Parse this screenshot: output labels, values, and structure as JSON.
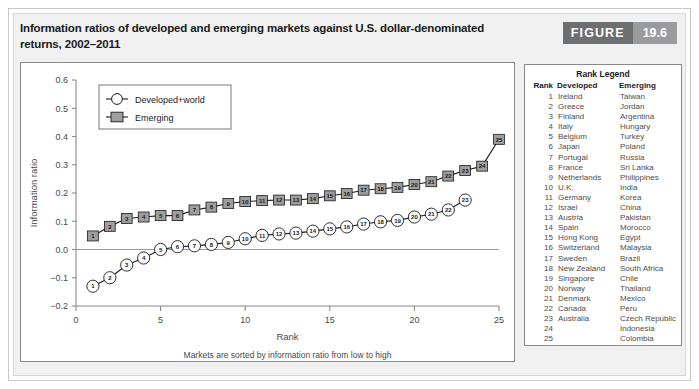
{
  "figure": {
    "title": "Information ratios of developed and emerging markets against U.S. dollar-denominated returns, 2002–2011",
    "badge_word": "FIGURE",
    "badge_number": "19.6"
  },
  "rank_legend": {
    "title": "Rank Legend",
    "headers": [
      "Rank",
      "Developed",
      "Emerging"
    ],
    "rows": [
      [
        "1",
        "Ireland",
        "Taiwan"
      ],
      [
        "2",
        "Greece",
        "Jordan"
      ],
      [
        "3",
        "Finland",
        "Argentina"
      ],
      [
        "4",
        "Italy",
        "Hungary"
      ],
      [
        "5",
        "Belgium",
        "Turkey"
      ],
      [
        "6",
        "Japan",
        "Poland"
      ],
      [
        "7",
        "Portugal",
        "Russia"
      ],
      [
        "8",
        "France",
        "Sri Lanka"
      ],
      [
        "9",
        "Netherlands",
        "Philippines"
      ],
      [
        "10",
        "U.K.",
        "India"
      ],
      [
        "11",
        "Germany",
        "Korea"
      ],
      [
        "12",
        "Israel",
        "China"
      ],
      [
        "13",
        "Austria",
        "Pakistan"
      ],
      [
        "14",
        "Spain",
        "Morocco"
      ],
      [
        "15",
        "Hong Kong",
        "Egypt"
      ],
      [
        "16",
        "Switzerland",
        "Malaysia"
      ],
      [
        "17",
        "Sweden",
        "Brazil"
      ],
      [
        "18",
        "New Zealand",
        "South Africa"
      ],
      [
        "19",
        "Singapore",
        "Chile"
      ],
      [
        "20",
        "Norway",
        "Thailand"
      ],
      [
        "21",
        "Denmark",
        "Mexico"
      ],
      [
        "22",
        "Canada",
        "Peru"
      ],
      [
        "23",
        "Australia",
        "Czech Republic"
      ],
      [
        "24",
        "",
        "Indonesia"
      ],
      [
        "25",
        "",
        "Colombia"
      ]
    ]
  },
  "chart_data": {
    "type": "line",
    "title": "",
    "xlabel": "Rank",
    "ylabel": "Information ratio",
    "note": "Markets are sorted by information ratio from low to high",
    "xlim": [
      0,
      25
    ],
    "ylim": [
      -0.2,
      0.6
    ],
    "xticks": [
      0,
      5,
      10,
      15,
      20,
      25
    ],
    "yticks": [
      -0.2,
      -0.1,
      0.0,
      0.1,
      0.2,
      0.3,
      0.4,
      0.5,
      0.6
    ],
    "ytick_labels": [
      "−0.2",
      "−0.1",
      "0.0",
      "0.1",
      "0.2",
      "0.3",
      "0.4",
      "0.5",
      "0.6"
    ],
    "grid": false,
    "zero_line": true,
    "legend_position": "top-left",
    "series": [
      {
        "name": "Developed+world",
        "marker": "open-circle",
        "color": "#ffffff",
        "edge_color": "#1a1a1a",
        "x": [
          1,
          2,
          3,
          4,
          5,
          6,
          7,
          8,
          9,
          10,
          11,
          12,
          13,
          14,
          15,
          16,
          17,
          18,
          19,
          20,
          21,
          22,
          23
        ],
        "values": [
          -0.13,
          -0.1,
          -0.055,
          -0.03,
          0.0,
          0.01,
          0.013,
          0.018,
          0.025,
          0.038,
          0.05,
          0.055,
          0.058,
          0.065,
          0.073,
          0.08,
          0.09,
          0.098,
          0.103,
          0.115,
          0.125,
          0.14,
          0.175
        ]
      },
      {
        "name": "Emerging",
        "marker": "filled-square",
        "color": "#9e9e9e",
        "edge_color": "#1a1a1a",
        "x": [
          1,
          2,
          3,
          4,
          5,
          6,
          7,
          8,
          9,
          10,
          11,
          12,
          13,
          14,
          15,
          16,
          17,
          18,
          19,
          20,
          21,
          22,
          23,
          24,
          25
        ],
        "values": [
          0.048,
          0.082,
          0.11,
          0.115,
          0.12,
          0.12,
          0.14,
          0.15,
          0.163,
          0.17,
          0.173,
          0.175,
          0.175,
          0.18,
          0.19,
          0.198,
          0.21,
          0.215,
          0.22,
          0.23,
          0.24,
          0.26,
          0.28,
          0.295,
          0.39
        ]
      }
    ]
  }
}
